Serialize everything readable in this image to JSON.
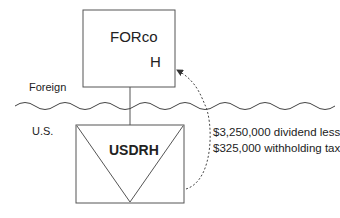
{
  "diagram": {
    "top_entity": {
      "name": "FORco",
      "suffix": "H"
    },
    "bottom_entity": {
      "name": "USDRH"
    },
    "regions": {
      "upper": "Foreign",
      "lower": "U.S."
    },
    "flow_annotation": {
      "line1": "$3,250,000 dividend less",
      "line2": "$325,000 withholding tax"
    },
    "colors": {
      "stroke": "#555555",
      "text": "#222222",
      "background": "#ffffff"
    }
  }
}
